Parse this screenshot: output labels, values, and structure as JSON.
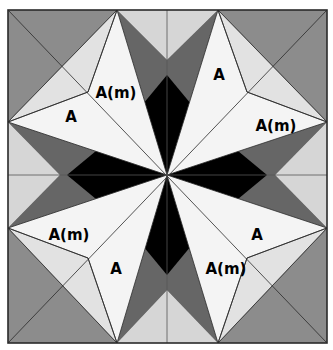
{
  "diagram": {
    "frame": {
      "x": 8,
      "y": 10,
      "w": 319,
      "h": 333
    },
    "center": {
      "x": 167,
      "y": 175
    },
    "colors": {
      "outer_gray": "#8c8c8c",
      "dark_gray": "#666666",
      "light_gray": "#d6d6d6",
      "white": "#f4f4f4",
      "black": "#000000",
      "line": "#2a2a2a"
    },
    "labels": [
      {
        "id": "label-tl-am",
        "text": "A(m)",
        "x": 116,
        "y": 98
      },
      {
        "id": "label-tl-a",
        "text": "A",
        "x": 71,
        "y": 122
      },
      {
        "id": "label-tr-a",
        "text": "A",
        "x": 219,
        "y": 80
      },
      {
        "id": "label-tr-am",
        "text": "A(m)",
        "x": 276,
        "y": 131
      },
      {
        "id": "label-bl-am",
        "text": "A(m)",
        "x": 69,
        "y": 240
      },
      {
        "id": "label-bl-a",
        "text": "A",
        "x": 116,
        "y": 274
      },
      {
        "id": "label-br-a",
        "text": "A",
        "x": 257,
        "y": 240
      },
      {
        "id": "label-br-am",
        "text": "A(m)",
        "x": 226,
        "y": 274
      }
    ]
  }
}
